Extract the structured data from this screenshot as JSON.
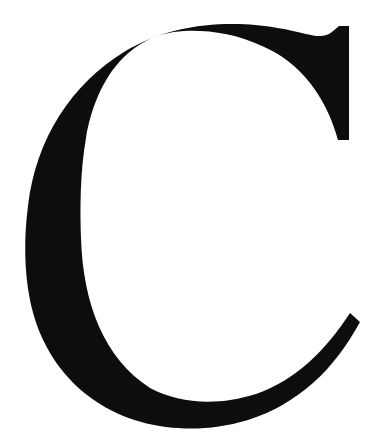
{
  "glyph": {
    "character": "C",
    "color": "#0d0d0d",
    "background": "#ffffff"
  }
}
